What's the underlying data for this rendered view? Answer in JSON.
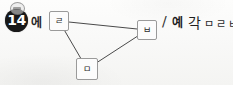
{
  "page": {
    "width": 233,
    "height": 85,
    "background_color": "#fbfbfa",
    "ink_color": "#2b2b2b"
  },
  "problem": {
    "number_label": "14",
    "number_marker_style": "filled-black-circle",
    "particle": "에"
  },
  "diagram": {
    "shape": "triangle",
    "vertices": [
      {
        "id": "left",
        "label": "ㄹ",
        "x": 59,
        "y": 21
      },
      {
        "id": "right",
        "label": "ㅂ",
        "x": 147,
        "y": 30
      },
      {
        "id": "bottom",
        "label": "ㅁ",
        "x": 87,
        "y": 69
      }
    ],
    "edges": [
      {
        "from": "left",
        "to": "right"
      },
      {
        "from": "right",
        "to": "bottom"
      },
      {
        "from": "bottom",
        "to": "left"
      }
    ],
    "stroke_color": "#4a4a4a",
    "stroke_width": 1
  },
  "answer": {
    "separator": "/",
    "prefix": "예",
    "word": "각",
    "jamo_sequence": "ㅁㄹㅂ",
    "full_text": "/ 예각 ㅁㄹㅂ"
  }
}
